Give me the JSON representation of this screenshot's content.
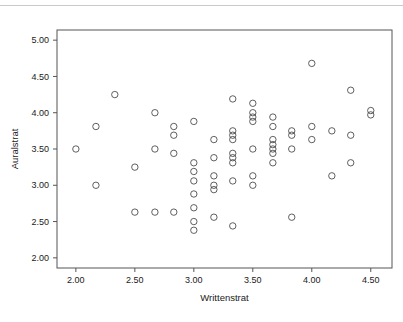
{
  "figure": {
    "background_color": "#ffffff",
    "top_rule_color": "#c9c9c9",
    "marker_color": "#4d4d4d",
    "frame_color": "#555555",
    "text_color": "#1a1a1a"
  },
  "chart_data": {
    "type": "scatter",
    "title": "",
    "xlabel": "Writtenstrat",
    "ylabel": "Auralstrat",
    "xlim": [
      1.84,
      4.68
    ],
    "ylim": [
      1.86,
      5.14
    ],
    "xticks": [
      2.0,
      2.5,
      3.0,
      3.5,
      4.0,
      4.5
    ],
    "xticklabels": [
      "2.00",
      "2.50",
      "3.00",
      "3.50",
      "4.00",
      "4.50"
    ],
    "yticks": [
      2.0,
      2.5,
      3.0,
      3.5,
      4.0,
      4.5,
      5.0
    ],
    "yticklabels": [
      "2.00",
      "2.50",
      "3.00",
      "3.50",
      "4.00",
      "4.50",
      "5.00"
    ],
    "grid": false,
    "legend": null,
    "marker": "open-circle",
    "marker_size": 3.2,
    "n_points": 78,
    "points": [
      [
        2.0,
        3.5
      ],
      [
        2.17,
        3.81
      ],
      [
        2.17,
        3.0
      ],
      [
        2.33,
        4.25
      ],
      [
        2.5,
        3.25
      ],
      [
        2.5,
        2.63
      ],
      [
        2.67,
        4.0
      ],
      [
        2.67,
        3.5
      ],
      [
        2.67,
        2.63
      ],
      [
        2.83,
        3.81
      ],
      [
        2.83,
        3.69
      ],
      [
        2.83,
        3.44
      ],
      [
        2.83,
        2.63
      ],
      [
        3.0,
        3.88
      ],
      [
        3.0,
        3.31
      ],
      [
        3.0,
        3.19
      ],
      [
        3.0,
        3.06
      ],
      [
        3.0,
        2.88
      ],
      [
        3.0,
        2.69
      ],
      [
        3.0,
        2.5
      ],
      [
        3.0,
        2.38
      ],
      [
        3.17,
        3.63
      ],
      [
        3.17,
        3.38
      ],
      [
        3.17,
        3.13
      ],
      [
        3.17,
        3.0
      ],
      [
        3.17,
        2.94
      ],
      [
        3.17,
        2.56
      ],
      [
        3.33,
        4.19
      ],
      [
        3.33,
        3.75
      ],
      [
        3.33,
        3.69
      ],
      [
        3.33,
        3.63
      ],
      [
        3.33,
        3.44
      ],
      [
        3.33,
        3.38
      ],
      [
        3.33,
        3.31
      ],
      [
        3.33,
        3.06
      ],
      [
        3.33,
        2.44
      ],
      [
        3.5,
        4.13
      ],
      [
        3.5,
        4.0
      ],
      [
        3.5,
        3.94
      ],
      [
        3.5,
        3.88
      ],
      [
        3.5,
        3.5
      ],
      [
        3.5,
        3.13
      ],
      [
        3.5,
        3.0
      ],
      [
        3.67,
        3.94
      ],
      [
        3.67,
        3.81
      ],
      [
        3.67,
        3.63
      ],
      [
        3.67,
        3.56
      ],
      [
        3.67,
        3.5
      ],
      [
        3.67,
        3.44
      ],
      [
        3.67,
        3.31
      ],
      [
        3.83,
        3.75
      ],
      [
        3.83,
        3.69
      ],
      [
        3.83,
        3.5
      ],
      [
        3.83,
        2.56
      ],
      [
        4.0,
        4.68
      ],
      [
        4.0,
        3.81
      ],
      [
        4.0,
        3.63
      ],
      [
        4.17,
        3.75
      ],
      [
        4.17,
        3.13
      ],
      [
        4.33,
        4.31
      ],
      [
        4.33,
        3.69
      ],
      [
        4.33,
        3.31
      ],
      [
        4.5,
        4.03
      ],
      [
        4.5,
        3.97
      ]
    ]
  }
}
